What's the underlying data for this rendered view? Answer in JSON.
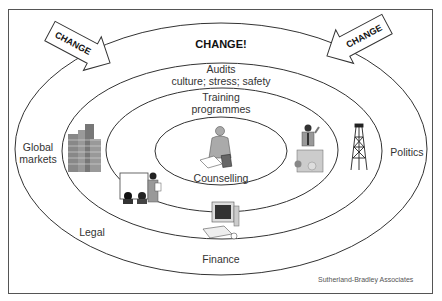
{
  "diagram": {
    "title_label": "CHANGE!",
    "arrows": [
      {
        "label": "CHANGE",
        "side": "left"
      },
      {
        "label": "CHANGE",
        "side": "right"
      }
    ],
    "rings": [
      {
        "name": "outer",
        "labels": [
          "Global markets",
          "Politics",
          "Legal",
          "Finance"
        ]
      },
      {
        "name": "audits",
        "label_line1": "Audits",
        "label_line2": "culture; stress; safety"
      },
      {
        "name": "training",
        "label_line1": "Training",
        "label_line2": "programmes"
      },
      {
        "name": "counselling",
        "label": "Counselling"
      }
    ],
    "outer_labels": {
      "global_line1": "Global",
      "global_line2": "markets",
      "politics": "Politics",
      "legal": "Legal",
      "finance": "Finance"
    },
    "icons": [
      "office-buildings-icon",
      "presenter-whiteboard-icon",
      "counsellor-writing-icon",
      "speaker-podium-icon",
      "oil-derrick-icon",
      "computer-icon"
    ],
    "credit": "Sutherland-Bradley Associates"
  }
}
